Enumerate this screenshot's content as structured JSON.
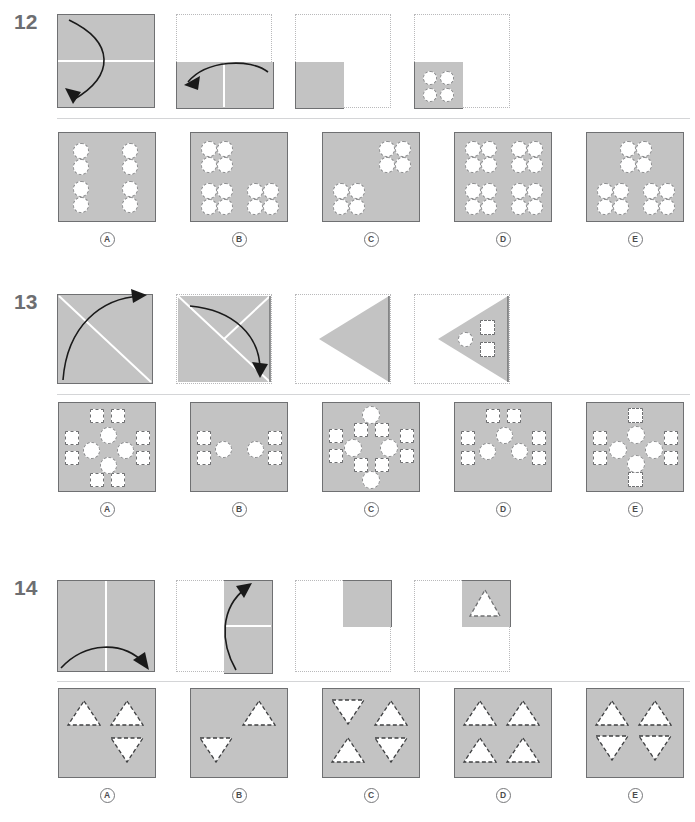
{
  "document": {
    "type": "paper-folding-punched-hole-test",
    "page_background": "#ffffff",
    "paper_gray": "#c3c3c3",
    "outline_gray": "#6f7072",
    "dotted_gray": "#b9b9bb",
    "text_gray": "#58595b"
  },
  "option_labels": [
    "A",
    "B",
    "C",
    "D",
    "E"
  ],
  "questions": [
    {
      "number": "12",
      "punch_shape": "circle",
      "fold_steps": [
        {
          "step": 1,
          "desc": "square-fold-bottom-to-top",
          "arrow": "down-left-curve"
        },
        {
          "step": 2,
          "desc": "bottom-half-fold-right-to-left",
          "arrow": "left-curve"
        },
        {
          "step": 3,
          "desc": "bottom-left-quadrant"
        },
        {
          "step": 4,
          "desc": "quadrant-with-four-holes-punched"
        }
      ],
      "punched_count": 4,
      "options": [
        {
          "label": "A",
          "groups": 4,
          "arrangement": "two-stacked-circles-x4"
        },
        {
          "label": "B",
          "groups": 3,
          "arrangement": "quad-cluster-top-left-bottom-left-bottom-right"
        },
        {
          "label": "C",
          "groups": 2,
          "arrangement": "quad-cluster-top-right-bottom-left"
        },
        {
          "label": "D",
          "groups": 4,
          "arrangement": "quad-cluster-all-four-corners"
        },
        {
          "label": "E",
          "groups": 3,
          "arrangement": "quad-cluster-top-center-bottom-left-bottom-right"
        }
      ]
    },
    {
      "number": "13",
      "punch_shape": "circle-and-square",
      "fold_steps": [
        {
          "step": 1,
          "desc": "square-fold-along-diagonal",
          "arrow": "up-right-curve"
        },
        {
          "step": 2,
          "desc": "triangle-fold-corner-down",
          "arrow": "down-right-curve"
        },
        {
          "step": 3,
          "desc": "left-pointing-triangle"
        },
        {
          "step": 4,
          "desc": "triangle-with-circle-and-two-squares-punched"
        }
      ],
      "punched_count": 3,
      "options": [
        {
          "label": "A",
          "arrangement": "diamond-of-4-circles-with-8-squares-around"
        },
        {
          "label": "B",
          "arrangement": "two-circles-center-with-4-squares-at-sides"
        },
        {
          "label": "C",
          "arrangement": "diamond-of-4-circles-with-squares-offset-up"
        },
        {
          "label": "D",
          "arrangement": "three-circles-with-6-squares"
        },
        {
          "label": "E",
          "arrangement": "diamond-of-4-circles-with-4-squares-cross"
        }
      ]
    },
    {
      "number": "14",
      "punch_shape": "triangle",
      "fold_steps": [
        {
          "step": 1,
          "desc": "square-fold-left-to-right",
          "arrow": "right-curve"
        },
        {
          "step": 2,
          "desc": "right-half-fold-bottom-to-top",
          "arrow": "up-curve"
        },
        {
          "step": 3,
          "desc": "top-right-quadrant"
        },
        {
          "step": 4,
          "desc": "quadrant-with-one-triangle-punched"
        }
      ],
      "punched_count": 1,
      "options": [
        {
          "label": "A",
          "arrangement": "two-up-triangles-top-one-down-bottom-right"
        },
        {
          "label": "B",
          "arrangement": "one-up-triangle-top-right-one-down-bottom-left"
        },
        {
          "label": "C",
          "arrangement": "down-up-top-row-up-down-bottom-row"
        },
        {
          "label": "D",
          "arrangement": "four-up-triangles"
        },
        {
          "label": "E",
          "arrangement": "two-up-top-row-two-down-bottom-row"
        }
      ]
    }
  ]
}
